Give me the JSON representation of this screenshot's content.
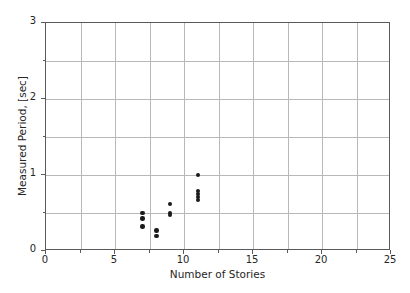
{
  "chart_data": {
    "type": "scatter",
    "title": "",
    "xlabel": "Number of Stories",
    "ylabel": "Measured Period, [sec]",
    "xlim": [
      0,
      25
    ],
    "ylim": [
      0,
      3
    ],
    "xticks": [
      0,
      5,
      10,
      15,
      20,
      25
    ],
    "xticklabels": [
      "0",
      "5",
      "10",
      "15",
      "20",
      "25"
    ],
    "xminorticks": [
      2.5,
      7.5,
      12.5,
      17.5,
      22.5
    ],
    "yticks": [
      0,
      1,
      2,
      3
    ],
    "yticklabels": [
      "0",
      "1",
      "2",
      "3"
    ],
    "yminorticks": [
      0.5,
      1.5,
      2.5
    ],
    "grid": true,
    "grid_color": "#b8b8b8",
    "marker_color": "#1a1a1a",
    "marker": "o",
    "legend": null,
    "series": [
      {
        "name": "Measured Period",
        "points": [
          {
            "x": 7,
            "y": 0.5
          },
          {
            "x": 7,
            "y": 0.43
          },
          {
            "x": 7,
            "y": 0.32
          },
          {
            "x": 8,
            "y": 0.27
          },
          {
            "x": 8,
            "y": 0.2
          },
          {
            "x": 9,
            "y": 0.62
          },
          {
            "x": 9,
            "y": 0.5
          },
          {
            "x": 9,
            "y": 0.47
          },
          {
            "x": 11,
            "y": 1.0
          },
          {
            "x": 11,
            "y": 0.79
          },
          {
            "x": 11,
            "y": 0.75
          },
          {
            "x": 11,
            "y": 0.71
          },
          {
            "x": 11,
            "y": 0.67
          }
        ]
      }
    ]
  },
  "figure": {
    "background": "#ffffff",
    "frame_color": "#5a5a5a"
  }
}
